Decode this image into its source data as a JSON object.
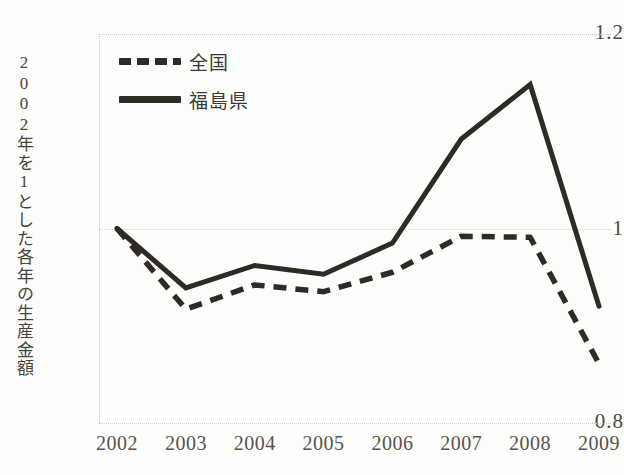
{
  "chart_data": {
    "type": "line",
    "title": "",
    "subtitle": "",
    "xlabel": "",
    "ylabel": "2002年を1とした各年の生産金額",
    "categories": [
      "2002",
      "2003",
      "2004",
      "2005",
      "2006",
      "2007",
      "2008",
      "2009"
    ],
    "x": [
      2002,
      2003,
      2004,
      2005,
      2006,
      2007,
      2008,
      2009
    ],
    "series": [
      {
        "name": "全国",
        "style": "dashed",
        "color": "#2e2a24",
        "values": [
          1.0,
          0.917,
          0.942,
          0.935,
          0.955,
          0.992,
          0.991,
          0.861
        ]
      },
      {
        "name": "福島県",
        "style": "solid",
        "color": "#2e2a24",
        "values": [
          1.0,
          0.939,
          0.962,
          0.953,
          0.985,
          1.092,
          1.148,
          0.92
        ]
      }
    ],
    "ylim": [
      0.8,
      1.2
    ],
    "yticks": [
      "1.2",
      "1",
      "0.8"
    ],
    "ytick_values": [
      1.2,
      1.0,
      0.8
    ],
    "xlim": [
      2002,
      2009
    ],
    "grid": "horizontal-at-1.0",
    "legend_position": "top-left-inside",
    "gridline_color": "#cfcec8",
    "border_color": "#c9c8c2",
    "background": "#fdfdfb"
  },
  "legend": {
    "entries": [
      {
        "label": "全国",
        "style": "dashed"
      },
      {
        "label": "福島県",
        "style": "solid"
      }
    ]
  },
  "axes": {
    "y_axis_title": "2002年を1とした各年の生産金額",
    "y_ticks": [
      "1.2",
      "1",
      "0.8"
    ],
    "x_ticks": [
      "2002",
      "2003",
      "2004",
      "2005",
      "2006",
      "2007",
      "2008",
      "2009"
    ]
  }
}
